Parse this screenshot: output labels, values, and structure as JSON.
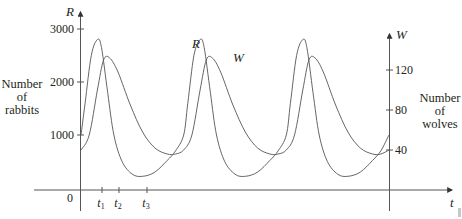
{
  "chart_data": {
    "type": "line",
    "title": "",
    "xlabel": "t",
    "ylabel_left": "R",
    "ylabel_right": "W",
    "left_axis_caption": [
      "Number",
      "of",
      "rabbits"
    ],
    "right_axis_caption": [
      "Number",
      "of",
      "wolves"
    ],
    "left_axis": {
      "ticks": [
        1000,
        2000,
        3000
      ],
      "range": [
        0,
        3300
      ]
    },
    "right_axis": {
      "ticks": [
        40,
        80,
        120
      ],
      "range": [
        0,
        156
      ]
    },
    "x_ticks": [
      "0",
      "t1",
      "t2",
      "t3"
    ],
    "x_tick_labels": {
      "origin": "0",
      "t1": "t",
      "t1_sub": "1",
      "t2": "t",
      "t2_sub": "2",
      "t3": "t",
      "t3_sub": "3"
    },
    "curve_labels": [
      "R",
      "W"
    ],
    "grid": false,
    "legend": "inline labels near second peaks",
    "series": [
      {
        "name": "R (rabbits)",
        "axis": "left",
        "x": [
          0,
          0.2,
          0.5,
          0.8,
          1.0,
          1.3,
          1.6,
          2.0,
          2.5,
          3.0,
          3.6,
          4.2,
          4.6,
          5.0
        ],
        "values": [
          1000,
          1600,
          2500,
          2800,
          2650,
          1800,
          1000,
          500,
          260,
          220,
          300,
          520,
          700,
          1000
        ],
        "period": 5.0,
        "peak": 2800,
        "min": 220
      },
      {
        "name": "W (wolves)",
        "axis": "right",
        "x": [
          0,
          0.4,
          0.8,
          1.1,
          1.4,
          1.8,
          2.4,
          3.0,
          3.6,
          4.2,
          4.6,
          5.0
        ],
        "values": [
          40,
          55,
          100,
          130,
          132,
          118,
          85,
          58,
          42,
          36,
          36,
          40
        ],
        "period": 5.0,
        "peak": 132,
        "min": 36
      }
    ],
    "cycles_shown": 3
  }
}
